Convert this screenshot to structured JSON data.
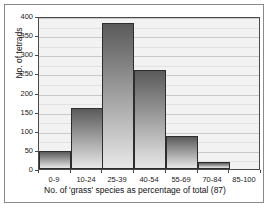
{
  "chart_data": {
    "type": "bar",
    "title": "",
    "subtitle": "",
    "xlabel": "No. of 'grass' species as percentage of total (87)",
    "ylabel": "No. of tetrads",
    "categories": [
      "0-9",
      "10-24",
      "25-39",
      "40-54",
      "55-69",
      "70-84",
      "85-100"
    ],
    "values": [
      48,
      159,
      382,
      259,
      87,
      17,
      0
    ],
    "ylim": [
      0,
      400
    ],
    "ytick_labels": [
      "0",
      "50",
      "100",
      "150",
      "200",
      "250",
      "300",
      "350",
      "400"
    ],
    "ytick_values": [
      0,
      50,
      100,
      150,
      200,
      250,
      300,
      350,
      400
    ],
    "minor_tick_step": 25,
    "grid": true,
    "grid_axis": "y",
    "legend": null,
    "bar_fill_top": "#5a5a5a",
    "bar_fill_bottom": "#e8e8e8",
    "bar_edge_color": "#2e2e2e",
    "plot_background": "#f2f2f2",
    "frame_color": "#8a8a8a"
  }
}
